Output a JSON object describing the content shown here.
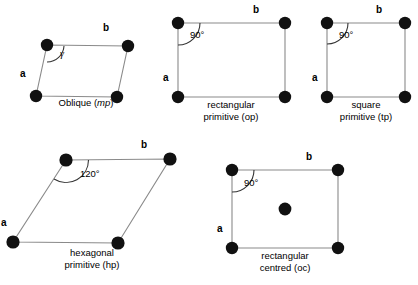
{
  "figure": {
    "stroke_color": "#7a7a7a",
    "node_color": "#111111",
    "background": "#ffffff"
  },
  "cells": [
    {
      "id": "oblique",
      "caption_line1": "Oblique (",
      "caption_italic": "mp",
      "caption_line2": ")",
      "caption_full": "Oblique (mp)",
      "angle_label": "γ",
      "a_label": "a",
      "b_label": "b",
      "vertices": {
        "top_left": [
          47,
          45
        ],
        "top_right": [
          128,
          46
        ],
        "bottom_right": [
          117,
          97
        ],
        "bottom_left": [
          36,
          96
        ]
      },
      "caption_x": 86,
      "caption_y": 99,
      "a_label_pos": [
        23,
        74
      ],
      "b_label_pos": [
        106,
        28
      ],
      "angle_label_pos": [
        63,
        53
      ],
      "has_centre_node": false
    },
    {
      "id": "rectangular-primitive",
      "caption_line1": "rectangular",
      "caption_line2": "primitive (op)",
      "caption_full": "rectangular primitive (op)",
      "angle_label": "90°",
      "a_label": "a",
      "b_label": "b",
      "vertices": {
        "top_left": [
          178,
          23
        ],
        "top_right": [
          285,
          23
        ],
        "bottom_right": [
          285,
          97
        ],
        "bottom_left": [
          178,
          97
        ]
      },
      "caption_x": 231,
      "caption_y": 100,
      "a_label_pos": [
        166,
        78
      ],
      "b_label_pos": [
        255,
        8
      ],
      "angle_label_pos": [
        192,
        32
      ],
      "has_centre_node": false
    },
    {
      "id": "square-primitive",
      "caption_line1": "square",
      "caption_line2": "primitive (tp)",
      "caption_full": "square primitive (tp)",
      "angle_label": "90°",
      "a_label": "a",
      "b_label": "b",
      "vertices": {
        "top_left": [
          327,
          23
        ],
        "top_right": [
          405,
          23
        ],
        "bottom_right": [
          405,
          97
        ],
        "bottom_left": [
          327,
          97
        ]
      },
      "caption_x": 366,
      "caption_y": 100,
      "a_label_pos": [
        315,
        78
      ],
      "b_label_pos": [
        378,
        8
      ],
      "angle_label_pos": [
        341,
        32
      ],
      "has_centre_node": false
    },
    {
      "id": "hexagonal-primitive",
      "caption_line1": "hexagonal",
      "caption_line2": "primitive (hp)",
      "caption_full": "hexagonal primitive (hp)",
      "angle_label": "120°",
      "a_label": "a",
      "b_label": "b",
      "vertices": {
        "top_left": [
          66,
          160
        ],
        "top_right": [
          170,
          159
        ],
        "bottom_right": [
          118,
          243
        ],
        "bottom_left": [
          13,
          242
        ]
      },
      "caption_x": 92,
      "caption_y": 248,
      "a_label_pos": [
        3,
        223
      ],
      "b_label_pos": [
        143,
        142
      ],
      "angle_label_pos": [
        84,
        172
      ],
      "has_centre_node": false
    },
    {
      "id": "rectangular-centred",
      "caption_line1": "rectangular",
      "caption_line2": "centred (oc)",
      "caption_full": "rectangular centred (oc)",
      "angle_label": "90°",
      "a_label": "a",
      "b_label": "b",
      "vertices": {
        "top_left": [
          232,
          170
        ],
        "top_right": [
          338,
          170
        ],
        "bottom_right": [
          338,
          248
        ],
        "bottom_left": [
          232,
          248
        ]
      },
      "centre_node": [
        285,
        209
      ],
      "caption_x": 285,
      "caption_y": 251,
      "a_label_pos": [
        220,
        228
      ],
      "b_label_pos": [
        308,
        155
      ],
      "angle_label_pos": [
        246,
        180
      ],
      "has_centre_node": true
    }
  ]
}
